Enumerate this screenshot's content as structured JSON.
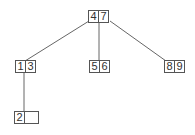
{
  "diagram": {
    "type": "b-tree",
    "nodes": {
      "root": {
        "keys": [
          "4",
          "7"
        ]
      },
      "left": {
        "keys": [
          "1",
          "3"
        ]
      },
      "middle": {
        "keys": [
          "5",
          "6"
        ]
      },
      "right": {
        "keys": [
          "8",
          "9"
        ]
      },
      "left_child": {
        "keys": [
          "2",
          ""
        ]
      }
    },
    "edges": [
      {
        "from": "root",
        "to": "left"
      },
      {
        "from": "root",
        "to": "middle"
      },
      {
        "from": "root",
        "to": "right"
      },
      {
        "from": "left",
        "to": "left_child"
      }
    ],
    "colors": {
      "line": "#666666",
      "border": "#555555",
      "text": "#333333"
    }
  }
}
